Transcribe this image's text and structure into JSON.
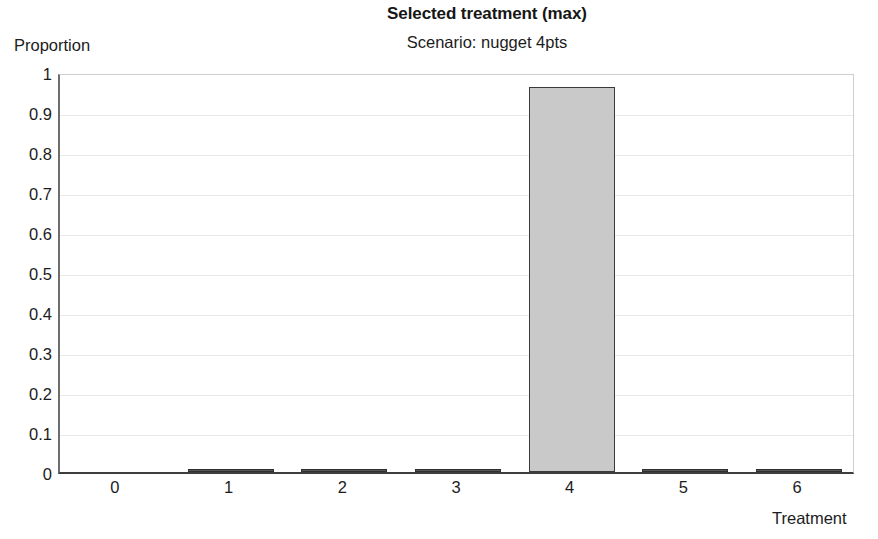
{
  "chart_data": {
    "type": "bar",
    "title": "Selected treatment (max)",
    "subtitle": "Scenario: nugget 4pts",
    "xlabel": "Treatment",
    "ylabel": "Proportion",
    "categories": [
      "0",
      "1",
      "2",
      "3",
      "4",
      "5",
      "6"
    ],
    "values": [
      0.0,
      0.006,
      0.005,
      0.005,
      0.963,
      0.005,
      0.006
    ],
    "ylim": [
      0,
      1
    ],
    "yticks": [
      "0",
      "0.1",
      "0.2",
      "0.3",
      "0.4",
      "0.5",
      "0.6",
      "0.7",
      "0.8",
      "0.9",
      "1"
    ],
    "ytick_values": [
      0,
      0.1,
      0.2,
      0.3,
      0.4,
      0.5,
      0.6,
      0.7,
      0.8,
      0.9,
      1
    ],
    "grid": true,
    "legend": null,
    "bar_fill_color": "#c9c9c9",
    "bar_edge_color": "#3a3a3a",
    "gridline_color": "#e9e9e9",
    "axis_color": "#3d3d3d",
    "background_color": "#ffffff"
  }
}
